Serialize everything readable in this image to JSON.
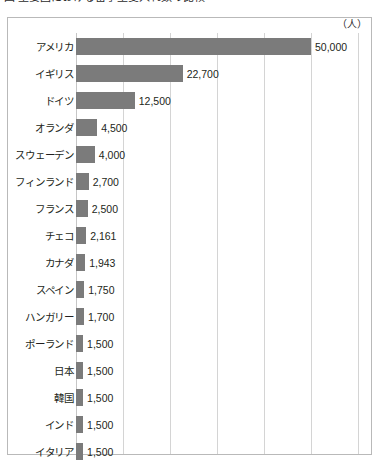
{
  "title": {
    "text": "図  主要国における留学生受入れ数の比較",
    "clipped": true
  },
  "unit_label": "（人）",
  "chart_data": {
    "type": "bar",
    "orientation": "horizontal",
    "title": "図  主要国における留学生受入れ数の比較",
    "xlabel": "",
    "ylabel": "",
    "unit": "（人）",
    "grid": true,
    "gridline_step": 10000,
    "xlim": [
      0,
      61700
    ],
    "legend": null,
    "categories": [
      "アメリカ",
      "イギリス",
      "ドイツ",
      "オランダ",
      "スウェーデン",
      "フィンランド",
      "フランス",
      "チェコ",
      "カナダ",
      "スペイン",
      "ハンガリー",
      "ポーランド",
      "日本",
      "韓国",
      "インド",
      "イタリア"
    ],
    "values": [
      50000,
      22700,
      12500,
      4500,
      4000,
      2700,
      2500,
      2161,
      1943,
      1750,
      1700,
      1500,
      1500,
      1500,
      1500,
      1500
    ],
    "value_labels": [
      "50,000",
      "22,700",
      "12,500",
      "4,500",
      "4,000",
      "2,700",
      "2,500",
      "2,161",
      "1,943",
      "1,750",
      "1,700",
      "1,500",
      "1,500",
      "1,500",
      "1,500",
      "1,500"
    ],
    "colors": {
      "bar": "#7b7b7b",
      "gridline": "#d4d4d4",
      "frame": "#b9b9b9",
      "text": "#231f20",
      "background": "#ffffff"
    }
  }
}
